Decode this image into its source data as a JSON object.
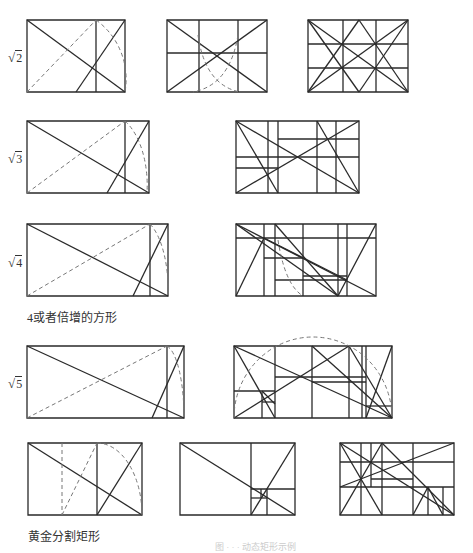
{
  "figure": {
    "stroke_color": "#2a2a2a",
    "dash_color": "#777777"
  },
  "rows": [
    {
      "label_symbol": "√",
      "label_value": "2",
      "label": "√2"
    },
    {
      "label_symbol": "√",
      "label_value": "3",
      "label": "√3"
    },
    {
      "label_symbol": "√",
      "label_value": "4",
      "label": "√4"
    },
    {
      "label_symbol": "√",
      "label_value": "5",
      "label": "√5"
    }
  ],
  "captions": {
    "root4": "4或者倍增的方形",
    "golden": "黄金分割矩形",
    "bottom_faint": "图 · · · 动态矩形示例"
  }
}
